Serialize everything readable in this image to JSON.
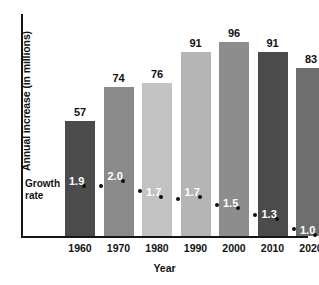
{
  "chart_data": {
    "type": "bar",
    "title": "",
    "subtitle": "",
    "xlabel": "Year",
    "ylabel": "Annual increase (in millions)",
    "categories": [
      "1960",
      "1970",
      "1980",
      "1990",
      "2000",
      "2010",
      "2020"
    ],
    "grid": false,
    "legend_position": "none",
    "ylim": [
      0,
      110
    ],
    "series": [
      {
        "name": "Annual increase (in millions)",
        "type": "bar",
        "values": [
          57,
          74,
          76,
          91,
          96,
          91,
          83
        ],
        "value_labels": [
          "57",
          "74",
          "76",
          "91",
          "96",
          "91",
          "83"
        ],
        "colors": [
          "#4b4b4b",
          "#8a8a8a",
          "#c2c2c2",
          "#b5b5b5",
          "#8d8d8d",
          "#4b4b4b",
          "#6e6e6e"
        ]
      },
      {
        "name": "Growth rate",
        "type": "line",
        "marker": "dot",
        "values": [
          1.9,
          2.0,
          1.7,
          1.7,
          1.5,
          1.3,
          1.0
        ],
        "value_labels": [
          "1.9",
          "2.0",
          "1.7",
          "1.7",
          "1.5",
          "1.3",
          "1.0"
        ]
      }
    ],
    "annotations": [
      {
        "text": "Growth",
        "line2": "rate"
      }
    ]
  },
  "axis": {
    "y_title": "Annual increase (in millions)",
    "x_title": "Year"
  },
  "growth_caption": {
    "line1": "Growth",
    "line2": "rate"
  }
}
